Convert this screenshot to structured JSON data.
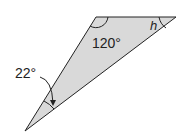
{
  "diagram": {
    "type": "triangle",
    "fill_color": "#d9d9d9",
    "stroke_color": "#222222",
    "vertices": {
      "top_left": [
        96,
        17
      ],
      "top_right": [
        176,
        17
      ],
      "bottom": [
        25,
        131
      ]
    },
    "angles": [
      {
        "vertex": "top_left",
        "label": "120°"
      },
      {
        "vertex": "top_right",
        "label": "h"
      },
      {
        "vertex": "bottom",
        "label": "22°"
      }
    ]
  }
}
